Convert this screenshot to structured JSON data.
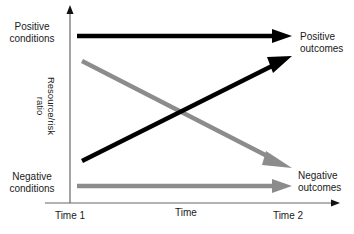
{
  "diagram": {
    "type": "conceptual-trajectory",
    "y_axis": {
      "label_line1": "Resource/risk",
      "label_line2": "ratio"
    },
    "x_axis": {
      "label": "Time",
      "start_label": "Time 1",
      "end_label": "Time 2"
    },
    "left_labels": {
      "top": {
        "line1": "Positive",
        "line2": "conditions"
      },
      "bottom": {
        "line1": "Negative",
        "line2": "conditions"
      }
    },
    "right_labels": {
      "top": {
        "line1": "Positive",
        "line2": "outcomes"
      },
      "bottom": {
        "line1": "Negative",
        "line2": "outcomes"
      }
    },
    "arrows": [
      {
        "name": "positive-to-positive",
        "color": "#000000",
        "from": "Positive conditions",
        "to": "Positive outcomes"
      },
      {
        "name": "positive-to-negative",
        "color": "#8c8c8c",
        "from": "Positive conditions",
        "to": "Negative outcomes"
      },
      {
        "name": "negative-to-positive",
        "color": "#000000",
        "from": "Negative conditions",
        "to": "Positive outcomes"
      },
      {
        "name": "negative-to-negative",
        "color": "#8c8c8c",
        "from": "Negative conditions",
        "to": "Negative outcomes"
      }
    ],
    "colors": {
      "black_arrow": "#000000",
      "gray_arrow": "#8c8c8c",
      "axis": "#555555"
    }
  }
}
